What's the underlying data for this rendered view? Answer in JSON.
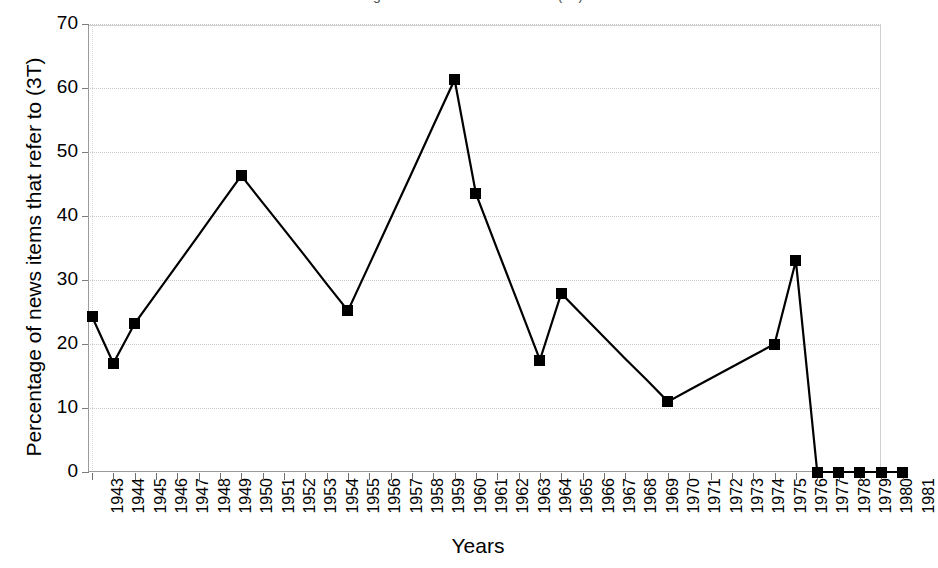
{
  "figure": {
    "clipped_title": "Percentage of news items that refer to (3T)",
    "background": "#ffffff",
    "series_color": "#000000",
    "grid_color": "#c8c8c8",
    "axis_color": "#9a9a9a"
  },
  "axes": {
    "y_title": "Percentage of news items that refer to (3T)",
    "x_title": "Years",
    "y_ticks": [
      "0",
      "10",
      "20",
      "30",
      "40",
      "50",
      "60",
      "70"
    ],
    "y_min": 0,
    "y_max": 70,
    "y_step": 10
  },
  "chart_data": {
    "type": "line",
    "title": "Percentage of news items that refer to (3T)",
    "xlabel": "Years",
    "ylabel": "Percentage of news items that refer to (3T)",
    "ylim": [
      0,
      70
    ],
    "ytick_step": 10,
    "grid": true,
    "legend": "none",
    "marker": "filled-square",
    "marker_note": "Markers drawn only at years that carry a measured value; intermediate years are connected by straight line segments without markers.",
    "categories": [
      "1943",
      "1944",
      "1945",
      "1946",
      "1947",
      "1948",
      "1949",
      "1950",
      "1951",
      "1952",
      "1953",
      "1954",
      "1955",
      "1956",
      "1957",
      "1958",
      "1959",
      "1960",
      "1961",
      "1962",
      "1963",
      "1964",
      "1965",
      "1966",
      "1967",
      "1968",
      "1969",
      "1970",
      "1971",
      "1972",
      "1973",
      "1974",
      "1975",
      "1976",
      "1977",
      "1978",
      "1979",
      "1980",
      "1981"
    ],
    "marked_points": [
      {
        "x": "1943",
        "y": 24.3
      },
      {
        "x": "1944",
        "y": 17.0
      },
      {
        "x": "1945",
        "y": 23.2
      },
      {
        "x": "1950",
        "y": 46.3
      },
      {
        "x": "1955",
        "y": 25.2
      },
      {
        "x": "1960",
        "y": 61.3
      },
      {
        "x": "1961",
        "y": 43.5
      },
      {
        "x": "1964",
        "y": 17.5
      },
      {
        "x": "1965",
        "y": 27.9
      },
      {
        "x": "1970",
        "y": 11.0
      },
      {
        "x": "1975",
        "y": 20.0
      },
      {
        "x": "1976",
        "y": 33.0
      },
      {
        "x": "1977",
        "y": 0.0
      },
      {
        "x": "1978",
        "y": 0.0
      },
      {
        "x": "1979",
        "y": 0.0
      },
      {
        "x": "1980",
        "y": 0.0
      },
      {
        "x": "1981",
        "y": 0.0
      }
    ],
    "values": [
      24.3,
      17.0,
      23.2,
      27.8,
      32.4,
      37.0,
      41.7,
      46.3,
      42.1,
      37.9,
      33.7,
      29.4,
      25.2,
      32.4,
      39.6,
      46.8,
      54.1,
      61.3,
      43.5,
      34.8,
      26.2,
      17.5,
      27.9,
      24.5,
      21.1,
      17.7,
      14.4,
      11.0,
      12.8,
      14.6,
      16.4,
      18.2,
      20.0,
      33.0,
      0.0,
      0.0,
      0.0,
      0.0,
      0.0
    ]
  }
}
